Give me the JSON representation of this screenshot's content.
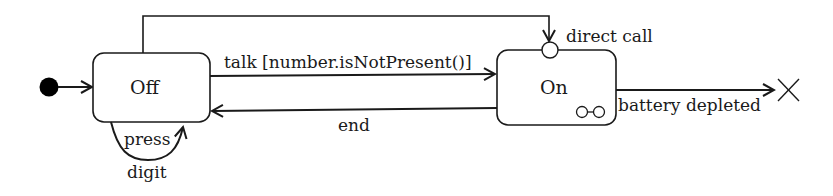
{
  "diagram": {
    "type": "uml-state-machine",
    "colors": {
      "stroke": "#1a1a1a",
      "fill": "#ffffff",
      "initial": "#000000"
    },
    "states": [
      {
        "id": "off",
        "label": "Off"
      },
      {
        "id": "on",
        "label": "On",
        "has_submachine_icon": true
      }
    ],
    "pseudostates": {
      "initial": "initial-node",
      "entry_point": "direct call",
      "terminate": "terminate-node"
    },
    "transitions": [
      {
        "from": "initial",
        "to": "off",
        "label": ""
      },
      {
        "from": "off",
        "to": "on",
        "label": "talk [number.isNotPresent()]"
      },
      {
        "from": "on",
        "to": "off",
        "label": "end"
      },
      {
        "from": "off",
        "to": "off",
        "label_line1": "press",
        "label_line2": "digit"
      },
      {
        "from": "off",
        "to": "on.direct_call",
        "label": "direct call"
      },
      {
        "from": "on",
        "to": "terminate",
        "label": "battery depleted"
      }
    ]
  }
}
